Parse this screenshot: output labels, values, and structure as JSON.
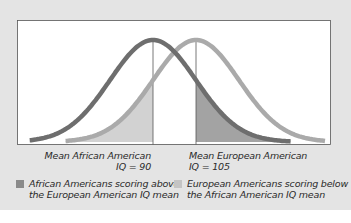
{
  "chart_data": {
    "type": "line",
    "title": "",
    "xlabel": "",
    "ylabel": "",
    "grid": false,
    "series": [
      {
        "name": "African American IQ distribution",
        "mean": 90,
        "sd": 15,
        "color": "#6e6e6e"
      },
      {
        "name": "European American IQ distribution",
        "mean": 105,
        "sd": 15,
        "color": "#aaaaaa"
      }
    ],
    "shaded_regions": [
      {
        "name": "African Americans scoring above the European American IQ mean",
        "series": "African American IQ distribution",
        "from": 105,
        "color": "#a3a3a3"
      },
      {
        "name": "European Americans scoring below the African American IQ mean",
        "series": "European American IQ distribution",
        "to": 90,
        "color": "#d2d2d2"
      }
    ],
    "reference_lines": [
      {
        "x": 90,
        "label": "Mean African American IQ = 90"
      },
      {
        "x": 105,
        "label": "Mean European American IQ = 105"
      }
    ],
    "legend_position": "bottom"
  },
  "labels": {
    "mean_aa_line1": "Mean African American",
    "mean_aa_line2": "IQ = 90",
    "mean_ea_line1": "Mean European American",
    "mean_ea_line2": "IQ = 105"
  },
  "legend": {
    "items": [
      {
        "line1": "African Americans scoring above",
        "line2": "the European American IQ mean",
        "color": "#8a8a8a"
      },
      {
        "line1": "European Americans scoring below",
        "line2": "the African American IQ mean",
        "color": "#c4c4c4"
      }
    ]
  },
  "colors": {
    "background": "#e4e4e4",
    "plot_bg": "#ffffff",
    "dark_curve": "#6e6e6e",
    "light_curve": "#aaaaaa",
    "dark_fill": "#a3a3a3",
    "light_fill": "#d2d2d2"
  }
}
